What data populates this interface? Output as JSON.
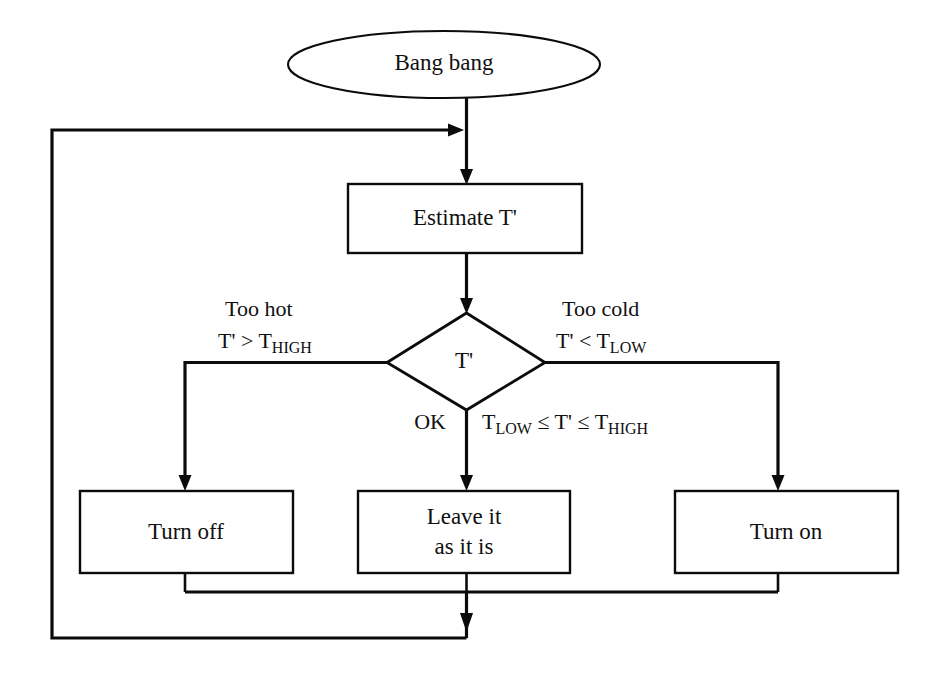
{
  "diagram": {
    "type": "flowchart",
    "background_color": "#ffffff",
    "line_color": "#0b0b0b",
    "text_color": "#101010"
  },
  "nodes": {
    "start": {
      "label": "Bang bang",
      "shape": "ellipse"
    },
    "estimate": {
      "label": "Estimate T'",
      "shape": "rectangle"
    },
    "decision": {
      "label": "T'",
      "shape": "diamond"
    },
    "turn_off": {
      "label": "Turn off",
      "shape": "rectangle"
    },
    "leave_line1": {
      "label": "Leave it",
      "shape": "rectangle"
    },
    "leave_line2": {
      "label": "as it is"
    },
    "turn_on": {
      "label": "Turn on",
      "shape": "rectangle"
    }
  },
  "edge_labels": {
    "too_hot_line1": "Too hot",
    "too_hot_cond_prefix": "T' > T",
    "too_hot_cond_sub": "HIGH",
    "too_cold_line1": "Too cold",
    "too_cold_cond_prefix": "T' < T",
    "too_cold_cond_sub": "LOW",
    "ok": "OK",
    "in_range_t_low": "T",
    "in_range_low_sub": "LOW",
    "in_range_mid": " ≤ T' ≤ T",
    "in_range_high_sub": "HIGH"
  }
}
